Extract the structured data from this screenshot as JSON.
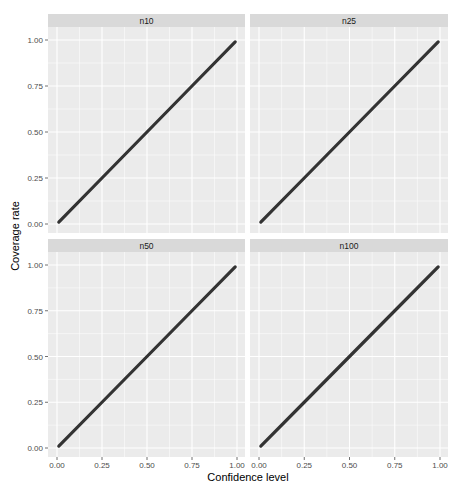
{
  "chart_data": {
    "type": "line",
    "title": "",
    "xlabel": "Confidence level",
    "ylabel": "Coverage rate",
    "xlim": [
      0,
      1
    ],
    "ylim": [
      0,
      1
    ],
    "x_ticks": [
      "0.00",
      "0.25",
      "0.50",
      "0.75",
      "1.00"
    ],
    "y_ticks": [
      "0.00",
      "0.25",
      "0.50",
      "0.75",
      "1.00"
    ],
    "grid": true,
    "legend": "none",
    "facets": [
      {
        "label": "n10",
        "x": [
          0.01,
          0.25,
          0.5,
          0.75,
          0.99
        ],
        "y": [
          0.01,
          0.25,
          0.5,
          0.75,
          0.99
        ]
      },
      {
        "label": "n25",
        "x": [
          0.01,
          0.25,
          0.5,
          0.75,
          0.99
        ],
        "y": [
          0.01,
          0.25,
          0.5,
          0.75,
          0.99
        ]
      },
      {
        "label": "n50",
        "x": [
          0.01,
          0.25,
          0.5,
          0.75,
          0.99
        ],
        "y": [
          0.01,
          0.25,
          0.5,
          0.75,
          0.99
        ]
      },
      {
        "label": "n100",
        "x": [
          0.01,
          0.25,
          0.5,
          0.75,
          0.99
        ],
        "y": [
          0.01,
          0.25,
          0.5,
          0.75,
          0.99
        ]
      }
    ],
    "colors": {
      "panel_bg": "#ebebeb",
      "strip_bg": "#d9d9d9",
      "grid_major": "#ffffff",
      "line": "#333333"
    }
  }
}
